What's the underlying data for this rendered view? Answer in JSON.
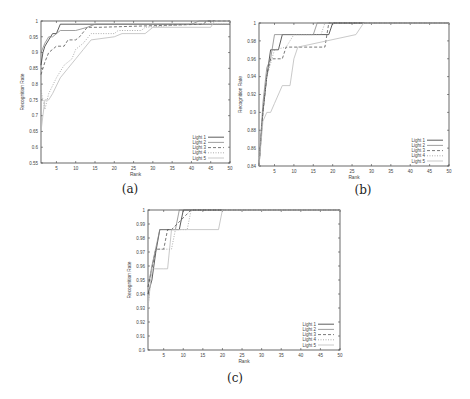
{
  "figure": {
    "captions": [
      "(a)",
      "(b)",
      "(c)"
    ]
  },
  "chart_data": [
    {
      "type": "line",
      "panel": "a",
      "title": "",
      "xlabel": "Rank",
      "ylabel": "Recognition Rate",
      "xlim": [
        1,
        50
      ],
      "ylim": [
        0.55,
        1
      ],
      "xticks": [
        5,
        10,
        15,
        20,
        25,
        30,
        35,
        40,
        45,
        50
      ],
      "yticks": [
        0.55,
        0.6,
        0.65,
        0.7,
        0.75,
        0.8,
        0.85,
        0.9,
        0.95,
        1
      ],
      "ytick_labels": [
        "0.55",
        "0.6",
        "0.65",
        "0.7",
        "0.75",
        "0.8",
        "0.85",
        "0.9",
        "0.95",
        "1"
      ],
      "grid": false,
      "legend_position": "lower right",
      "series": [
        {
          "name": "Light 1",
          "style": "solid",
          "color": "#333333",
          "x": [
            1,
            1.5,
            2,
            3,
            4,
            5,
            6,
            50
          ],
          "y": [
            0.86,
            0.9,
            0.92,
            0.94,
            0.96,
            0.96,
            0.99,
            0.99
          ]
        },
        {
          "name": "Light 2",
          "style": "solid",
          "color": "#888888",
          "x": [
            1,
            2,
            3,
            4,
            6,
            10,
            13,
            15,
            20,
            40,
            42,
            50
          ],
          "y": [
            0.9,
            0.93,
            0.95,
            0.95,
            0.97,
            0.97,
            0.98,
            0.99,
            0.99,
            0.99,
            1,
            1
          ]
        },
        {
          "name": "Light 3",
          "style": "dashed",
          "color": "#555555",
          "x": [
            1,
            2,
            3,
            4,
            5,
            7,
            8,
            10,
            11,
            13,
            16,
            43,
            44,
            50
          ],
          "y": [
            0.83,
            0.87,
            0.9,
            0.91,
            0.92,
            0.92,
            0.94,
            0.94,
            0.95,
            0.98,
            0.98,
            0.99,
            1,
            1
          ]
        },
        {
          "name": "Light 4",
          "style": "dotted",
          "color": "#999999",
          "x": [
            1,
            2,
            3,
            5,
            7,
            9,
            10,
            12,
            14,
            20,
            21,
            27,
            28,
            40,
            50
          ],
          "y": [
            0.78,
            0.72,
            0.77,
            0.82,
            0.86,
            0.88,
            0.91,
            0.93,
            0.96,
            0.96,
            0.97,
            0.97,
            0.98,
            0.99,
            0.99
          ]
        },
        {
          "name": "Light 5",
          "style": "solid",
          "color": "#bbbbbb",
          "x": [
            1,
            1.5,
            2,
            3,
            4,
            6,
            8,
            10,
            12,
            14,
            20,
            22,
            28,
            30,
            45,
            46,
            50
          ],
          "y": [
            0.65,
            0.7,
            0.75,
            0.75,
            0.77,
            0.82,
            0.85,
            0.88,
            0.91,
            0.94,
            0.95,
            0.96,
            0.96,
            0.98,
            0.98,
            1,
            1
          ]
        }
      ]
    },
    {
      "type": "line",
      "panel": "b",
      "title": "",
      "xlabel": "Rank",
      "ylabel": "Recognition Rate",
      "xlim": [
        1,
        50
      ],
      "ylim": [
        0.84,
        1
      ],
      "xticks": [
        5,
        10,
        15,
        20,
        25,
        30,
        35,
        40,
        45,
        50
      ],
      "yticks": [
        0.84,
        0.86,
        0.88,
        0.9,
        0.92,
        0.94,
        0.96,
        0.98,
        1
      ],
      "ytick_labels": [
        "0.84",
        "0.86",
        "0.88",
        "0.9",
        "0.92",
        "0.94",
        "0.96",
        "0.98",
        "1"
      ],
      "grid": false,
      "legend_position": "lower right",
      "series": [
        {
          "name": "Light 1",
          "style": "solid",
          "color": "#333333",
          "x": [
            1,
            2,
            3,
            4,
            6,
            7,
            19,
            20,
            50
          ],
          "y": [
            0.84,
            0.9,
            0.94,
            0.97,
            0.97,
            0.987,
            0.987,
            1,
            1
          ]
        },
        {
          "name": "Light 2",
          "style": "solid",
          "color": "#888888",
          "x": [
            1,
            2,
            3,
            4,
            5,
            15,
            16,
            50
          ],
          "y": [
            0.84,
            0.91,
            0.95,
            0.96,
            0.987,
            0.987,
            1,
            1
          ]
        },
        {
          "name": "Light 3",
          "style": "dashed",
          "color": "#555555",
          "x": [
            1,
            2,
            3,
            4,
            7,
            8,
            9,
            18,
            19,
            50
          ],
          "y": [
            0.84,
            0.9,
            0.94,
            0.96,
            0.96,
            0.973,
            0.973,
            0.973,
            1,
            1
          ]
        },
        {
          "name": "Light 4",
          "style": "dotted",
          "color": "#999999",
          "x": [
            1,
            2,
            3,
            5,
            8,
            10,
            17,
            18,
            50
          ],
          "y": [
            0.85,
            0.9,
            0.94,
            0.97,
            0.973,
            0.987,
            0.987,
            1,
            1
          ]
        },
        {
          "name": "Light 5",
          "style": "solid",
          "color": "#bbbbbb",
          "x": [
            1,
            2,
            3,
            4,
            5,
            7,
            9,
            10,
            11,
            26,
            28,
            50
          ],
          "y": [
            0.84,
            0.89,
            0.9,
            0.9,
            0.91,
            0.93,
            0.93,
            0.96,
            0.973,
            0.987,
            1,
            1
          ]
        }
      ]
    },
    {
      "type": "line",
      "panel": "c",
      "title": "",
      "xlabel": "Rank",
      "ylabel": "Recognition Rate",
      "xlim": [
        1,
        50
      ],
      "ylim": [
        0.9,
        1
      ],
      "xticks": [
        5,
        10,
        15,
        20,
        25,
        30,
        35,
        40,
        45,
        50
      ],
      "yticks": [
        0.9,
        0.91,
        0.92,
        0.93,
        0.94,
        0.95,
        0.96,
        0.97,
        0.98,
        0.99,
        1
      ],
      "ytick_labels": [
        "0.9",
        "0.91",
        "0.92",
        "0.93",
        "0.94",
        "0.95",
        "0.96",
        "0.97",
        "0.98",
        "0.99",
        "1"
      ],
      "grid": false,
      "legend_position": "lower right",
      "series": [
        {
          "name": "Light 1",
          "style": "solid",
          "color": "#333333",
          "x": [
            1,
            2,
            3,
            4,
            9,
            10,
            50
          ],
          "y": [
            0.94,
            0.95,
            0.97,
            0.986,
            0.986,
            1,
            1
          ]
        },
        {
          "name": "Light 2",
          "style": "solid",
          "color": "#888888",
          "x": [
            1,
            2,
            4,
            8,
            9,
            50
          ],
          "y": [
            0.945,
            0.96,
            0.986,
            0.986,
            1,
            1
          ]
        },
        {
          "name": "Light 3",
          "style": "dashed",
          "color": "#555555",
          "x": [
            1,
            2,
            3,
            4,
            5,
            6,
            7,
            12,
            50
          ],
          "y": [
            0.945,
            0.958,
            0.972,
            0.972,
            0.972,
            0.986,
            0.986,
            1,
            1
          ]
        },
        {
          "name": "Light 4",
          "style": "dotted",
          "color": "#999999",
          "x": [
            1,
            2,
            3,
            7,
            8,
            11,
            12,
            50
          ],
          "y": [
            0.93,
            0.96,
            0.972,
            0.972,
            0.986,
            0.986,
            1,
            1
          ]
        },
        {
          "name": "Light 5",
          "style": "solid",
          "color": "#bbbbbb",
          "x": [
            1,
            2,
            3,
            5,
            6,
            7,
            19,
            20,
            50
          ],
          "y": [
            0.93,
            0.958,
            0.958,
            0.958,
            0.958,
            0.986,
            0.986,
            1,
            1
          ]
        }
      ]
    }
  ]
}
